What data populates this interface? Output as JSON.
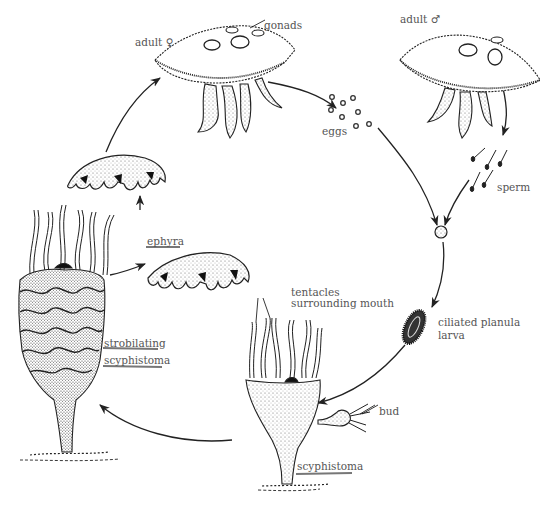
{
  "diagram": {
    "type": "life-cycle",
    "stages": [
      {
        "id": "adult_female",
        "label": "adult ♀"
      },
      {
        "id": "adult_male",
        "label": "adult ♂"
      },
      {
        "id": "eggs",
        "label": "eggs"
      },
      {
        "id": "sperm",
        "label": "sperm"
      },
      {
        "id": "zygote",
        "label": ""
      },
      {
        "id": "planula",
        "label_line1": "ciliated planula",
        "label_line2": "larva"
      },
      {
        "id": "scyphistoma",
        "label": "scyphistoma"
      },
      {
        "id": "strobilating",
        "label_line1": "strobilating",
        "label_line2": "scyphistoma"
      },
      {
        "id": "ephyra",
        "label": "ephyra"
      },
      {
        "id": "young_medusa",
        "label": ""
      }
    ],
    "annotations": {
      "gonads": "gonads",
      "tentacles_line1": "tentacles",
      "tentacles_line2": "surrounding mouth",
      "bud": "bud"
    },
    "flow": [
      "adult_female",
      "eggs",
      "zygote",
      "planula",
      "scyphistoma",
      "strobilating",
      "ephyra",
      "young_medusa",
      "adult_female"
    ],
    "flow_also": [
      "adult_male",
      "sperm",
      "zygote"
    ]
  }
}
